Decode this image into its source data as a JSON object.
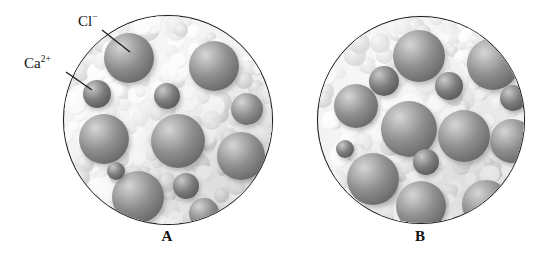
{
  "figure": {
    "type": "scientific-illustration",
    "background_color": "#ffffff",
    "outline_color": "#1a1a1a"
  },
  "labels": {
    "chloride": {
      "text": "Cl",
      "charge": "−",
      "name": "chloride-ion-label",
      "x": 78,
      "y": 12
    },
    "calcium": {
      "text": "Ca",
      "charge": "2+",
      "name": "calcium-ion-label",
      "x": 24,
      "y": 54
    }
  },
  "panels": [
    {
      "id": "A",
      "label": "A",
      "label_x": 167,
      "label_y": 238,
      "circle": {
        "cx": 167,
        "cy": 119,
        "r": 104
      },
      "concentration": "dilute",
      "ion_counts": {
        "chloride": 8,
        "calcium": 4
      },
      "ions": [
        {
          "type": "chloride",
          "cx": 128,
          "cy": 57,
          "r": 25
        },
        {
          "type": "chloride",
          "cx": 213,
          "cy": 65,
          "r": 25
        },
        {
          "type": "chloride",
          "cx": 103,
          "cy": 138,
          "r": 25
        },
        {
          "type": "chloride",
          "cx": 177,
          "cy": 140,
          "r": 27
        },
        {
          "type": "chloride",
          "cx": 240,
          "cy": 155,
          "r": 24
        },
        {
          "type": "chloride",
          "cx": 137,
          "cy": 196,
          "r": 26
        },
        {
          "type": "chloride",
          "cx": 246,
          "cy": 108,
          "r": 16
        },
        {
          "type": "chloride",
          "cx": 203,
          "cy": 212,
          "r": 15
        },
        {
          "type": "calcium",
          "cx": 96,
          "cy": 93,
          "r": 14
        },
        {
          "type": "calcium",
          "cx": 166,
          "cy": 95,
          "r": 13
        },
        {
          "type": "calcium",
          "cx": 185,
          "cy": 185,
          "r": 13
        },
        {
          "type": "calcium",
          "cx": 115,
          "cy": 170,
          "r": 9
        }
      ]
    },
    {
      "id": "B",
      "label": "B",
      "label_x": 420,
      "label_y": 238,
      "circle": {
        "cx": 420,
        "cy": 119,
        "r": 103
      },
      "concentration": "concentrated",
      "ion_counts": {
        "chloride": 9,
        "calcium": 5
      },
      "ions": [
        {
          "type": "chloride",
          "cx": 418,
          "cy": 55,
          "r": 26
        },
        {
          "type": "chloride",
          "cx": 492,
          "cy": 63,
          "r": 26
        },
        {
          "type": "chloride",
          "cx": 408,
          "cy": 128,
          "r": 28
        },
        {
          "type": "chloride",
          "cx": 463,
          "cy": 135,
          "r": 26
        },
        {
          "type": "chloride",
          "cx": 511,
          "cy": 140,
          "r": 22
        },
        {
          "type": "chloride",
          "cx": 372,
          "cy": 178,
          "r": 26
        },
        {
          "type": "chloride",
          "cx": 420,
          "cy": 205,
          "r": 25
        },
        {
          "type": "chloride",
          "cx": 485,
          "cy": 203,
          "r": 24
        },
        {
          "type": "chloride",
          "cx": 355,
          "cy": 105,
          "r": 22
        },
        {
          "type": "calcium",
          "cx": 383,
          "cy": 80,
          "r": 15
        },
        {
          "type": "calcium",
          "cx": 448,
          "cy": 85,
          "r": 14
        },
        {
          "type": "calcium",
          "cx": 512,
          "cy": 97,
          "r": 13
        },
        {
          "type": "calcium",
          "cx": 425,
          "cy": 161,
          "r": 13
        },
        {
          "type": "calcium",
          "cx": 344,
          "cy": 148,
          "r": 9
        }
      ]
    }
  ],
  "colors": {
    "chloride_sphere": "#8e8e8e",
    "chloride_highlight": "#d6d6d6",
    "chloride_shadow": "#5a5a5a",
    "calcium_sphere": "#7c7c7c",
    "calcium_highlight": "#c9c9c9",
    "calcium_shadow": "#4d4d4d",
    "water_light": "#fbfbfb",
    "water_mid": "#e4e4e4",
    "water_shade": "#cfcfcf"
  }
}
